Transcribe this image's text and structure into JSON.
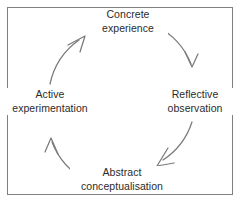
{
  "figure": {
    "background_color": "#ffffff",
    "border_color": "#808080",
    "stroke_color": "#7a7a7a",
    "text_color": "#2b2b2b",
    "direction": "clockwise"
  },
  "nodes": [
    {
      "id": "concrete-experience",
      "position": "top",
      "line1": "Concrete",
      "line2": "experience"
    },
    {
      "id": "reflective-observation",
      "position": "right",
      "line1": "Reflective",
      "line2": "observation"
    },
    {
      "id": "abstract-conceptualisation",
      "position": "bottom",
      "line1": "Abstract",
      "line2": "conceptualisation"
    },
    {
      "id": "active-experimentation",
      "position": "left",
      "line1": "Active",
      "line2": "experimentation"
    }
  ],
  "arrows": [
    {
      "id": "concrete-to-reflective",
      "from": "concrete-experience",
      "to": "reflective-observation",
      "direction": "clockwise"
    },
    {
      "id": "reflective-to-abstract",
      "from": "reflective-observation",
      "to": "abstract-conceptualisation",
      "direction": "clockwise"
    },
    {
      "id": "abstract-to-active",
      "from": "abstract-conceptualisation",
      "to": "active-experimentation",
      "direction": "clockwise"
    },
    {
      "id": "active-to-concrete",
      "from": "active-experimentation",
      "to": "concrete-experience",
      "direction": "clockwise"
    }
  ]
}
